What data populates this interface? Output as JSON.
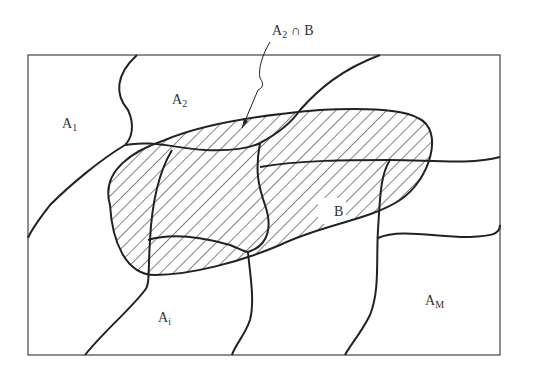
{
  "figure": {
    "type": "partition-venn",
    "colors": {
      "stroke": "#222222",
      "hatch": "#333333",
      "background": "#ffffff"
    }
  },
  "labels": {
    "annotation": {
      "base": "A",
      "sub": "2",
      "rest": " ∩ B"
    },
    "a1": {
      "base": "A",
      "sub": "1"
    },
    "a2": {
      "base": "A",
      "sub": "2"
    },
    "ai": {
      "base": "A",
      "sub": "i"
    },
    "am": {
      "base": "A",
      "sub": "M"
    },
    "b": {
      "base": "B"
    }
  }
}
